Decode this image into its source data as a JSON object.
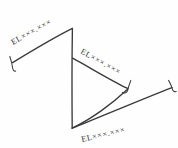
{
  "drawing": {
    "title": "Elevation Callout Diagram",
    "background_color": "#fefefe",
    "line_color": "#3a3a3a",
    "text_color": "#2e2e2e",
    "callouts": [
      {
        "id": "upper-left",
        "text": "EL×××.×××",
        "rotation_deg": -29
      },
      {
        "id": "middle-right",
        "text": "EL×××.×××",
        "rotation_deg": 29
      },
      {
        "id": "lower-right",
        "text": "EL×××.×××",
        "rotation_deg": -13
      }
    ],
    "geometry": {
      "triangle_apex_top": "72,28",
      "triangle_apex_bottom": "72,128",
      "triangle_vertex_right": "128,88",
      "upper_leader_start": "12,62",
      "upper_leader_end": "72,28",
      "middle_leader_start": "72,58",
      "middle_leader_end": "128,88",
      "lower_leader_start": "72,128",
      "lower_leader_end": "172,88"
    },
    "tick_marks": [
      {
        "id": "upper-left-terminator",
        "position": "12,62"
      },
      {
        "id": "middle-right-terminator",
        "position": "128,88"
      },
      {
        "id": "lower-right-terminator",
        "position": "172,88"
      }
    ]
  }
}
